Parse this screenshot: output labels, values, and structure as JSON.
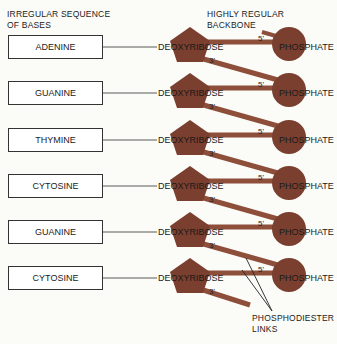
{
  "labels": {
    "bases_heading_line1": "IRREGULAR SEQUENCE",
    "bases_heading_line2": "OF BASES",
    "backbone_heading_line1": "HIGHLY REGULAR",
    "backbone_heading_line2": "BACKBONE",
    "links_line1": "PHOSPHODIESTER",
    "links_line2": "LINKS"
  },
  "sugar_label": "DEOXYRIBOSE",
  "phosphate_label": "PHOSPHATE",
  "prime5": "5'",
  "prime3": "3'",
  "bases": [
    {
      "name": "ADENINE"
    },
    {
      "name": "GUANINE"
    },
    {
      "name": "THYMINE"
    },
    {
      "name": "CYTOSINE"
    },
    {
      "name": "GUANINE"
    },
    {
      "name": "CYTOSINE"
    }
  ],
  "colors": {
    "backbone": "#7a3f2e",
    "stick": "#8d4e3a",
    "text": "#222222"
  }
}
